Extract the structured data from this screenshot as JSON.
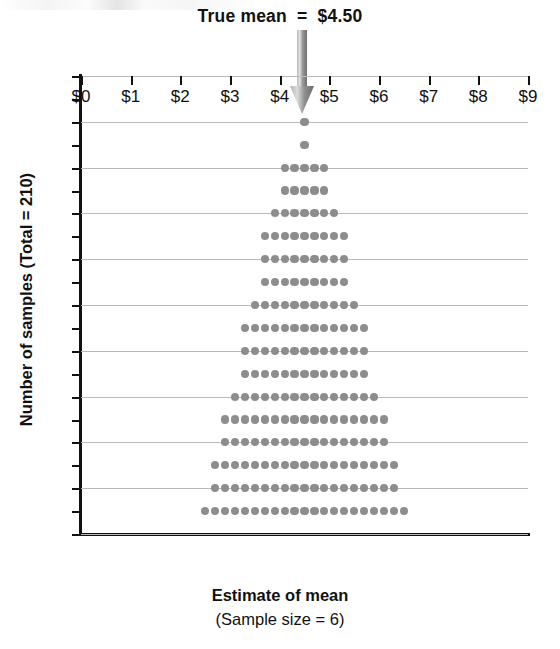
{
  "annotation": {
    "text": "True mean  =  $4.50",
    "arrow_icon": "down-arrow-icon",
    "arrow_value": 4.5,
    "arrow_color": "#8d8d8d"
  },
  "axes": {
    "x": {
      "title": "Estimate of mean",
      "subtitle": "(Sample size = 6)",
      "tick_labels": [
        "$0",
        "$1",
        "$2",
        "$3",
        "$4",
        "$5",
        "$6",
        "$7",
        "$8",
        "$9"
      ],
      "tick_values": [
        0,
        1,
        2,
        3,
        4,
        5,
        6,
        7,
        8,
        9
      ],
      "range": [
        0,
        9
      ]
    },
    "y": {
      "title": "Number of samples (Total = 210)",
      "tick_labels": [
        "0",
        "2",
        "4",
        "6",
        "8",
        "10",
        "12",
        "14",
        "16",
        "18",
        "20"
      ],
      "tick_values": [
        0,
        2,
        4,
        6,
        8,
        10,
        12,
        14,
        16,
        18,
        20
      ],
      "minor_tick_values": [
        1,
        3,
        5,
        7,
        9,
        11,
        13,
        15,
        17,
        19
      ],
      "range": [
        0,
        20
      ]
    }
  },
  "style": {
    "dot_color": "#8d8d8d",
    "grid_color": "#b9b9b9",
    "axis_color": "#111111",
    "background": "#ffffff"
  },
  "chart_data": {
    "type": "scatter",
    "subtype": "dotplot-sampling-distribution",
    "title": "True mean  =  $4.50",
    "xlabel": "Estimate of mean",
    "xsublabel": "(Sample size = 6)",
    "ylabel": "Number of samples (Total = 210)",
    "xlim": [
      0,
      9
    ],
    "ylim": [
      0,
      20
    ],
    "grid": "horizontal",
    "legend": "none",
    "bin_width": 0.2,
    "total_samples": 210,
    "true_mean": 4.5,
    "sample_size": 6,
    "annotations": [
      {
        "type": "arrow",
        "label": "True mean  =  $4.50",
        "x": 4.5,
        "points_to": 18
      }
    ],
    "stacks": [
      {
        "row": 18,
        "count": 1,
        "x_start": 4.5,
        "x_values": [
          4.5
        ]
      },
      {
        "row": 17,
        "count": 1,
        "x_start": 4.5,
        "x_values": [
          4.5
        ]
      },
      {
        "row": 16,
        "count": 5,
        "x_start": 4.1,
        "x_values": [
          4.1,
          4.3,
          4.5,
          4.7,
          4.9
        ]
      },
      {
        "row": 15,
        "count": 5,
        "x_start": 4.1,
        "x_values": [
          4.1,
          4.3,
          4.5,
          4.7,
          4.9
        ]
      },
      {
        "row": 14,
        "count": 7,
        "x_start": 3.9,
        "x_values": [
          3.9,
          4.1,
          4.3,
          4.5,
          4.7,
          4.9,
          5.1
        ]
      },
      {
        "row": 13,
        "count": 9,
        "x_start": 3.7,
        "x_values": [
          3.7,
          3.9,
          4.1,
          4.3,
          4.5,
          4.7,
          4.9,
          5.1,
          5.3
        ]
      },
      {
        "row": 12,
        "count": 9,
        "x_start": 3.7,
        "x_values": [
          3.7,
          3.9,
          4.1,
          4.3,
          4.5,
          4.7,
          4.9,
          5.1,
          5.3
        ]
      },
      {
        "row": 11,
        "count": 9,
        "x_start": 3.7,
        "x_values": [
          3.7,
          3.9,
          4.1,
          4.3,
          4.5,
          4.7,
          4.9,
          5.1,
          5.3
        ]
      },
      {
        "row": 10,
        "count": 11,
        "x_start": 3.5,
        "x_values": [
          3.5,
          3.7,
          3.9,
          4.1,
          4.3,
          4.5,
          4.7,
          4.9,
          5.1,
          5.3,
          5.5
        ]
      },
      {
        "row": 9,
        "count": 13,
        "x_start": 3.3,
        "x_values": [
          3.3,
          3.5,
          3.7,
          3.9,
          4.1,
          4.3,
          4.5,
          4.7,
          4.9,
          5.1,
          5.3,
          5.5,
          5.7
        ]
      },
      {
        "row": 8,
        "count": 13,
        "x_start": 3.3,
        "x_values": [
          3.3,
          3.5,
          3.7,
          3.9,
          4.1,
          4.3,
          4.5,
          4.7,
          4.9,
          5.1,
          5.3,
          5.5,
          5.7
        ]
      },
      {
        "row": 7,
        "count": 13,
        "x_start": 3.3,
        "x_values": [
          3.3,
          3.5,
          3.7,
          3.9,
          4.1,
          4.3,
          4.5,
          4.7,
          4.9,
          5.1,
          5.3,
          5.5,
          5.7
        ]
      },
      {
        "row": 6,
        "count": 15,
        "x_start": 3.1,
        "x_values": [
          3.1,
          3.3,
          3.5,
          3.7,
          3.9,
          4.1,
          4.3,
          4.5,
          4.7,
          4.9,
          5.1,
          5.3,
          5.5,
          5.7,
          5.9
        ]
      },
      {
        "row": 5,
        "count": 17,
        "x_start": 2.9,
        "x_values": [
          2.9,
          3.1,
          3.3,
          3.5,
          3.7,
          3.9,
          4.1,
          4.3,
          4.5,
          4.7,
          4.9,
          5.1,
          5.3,
          5.5,
          5.7,
          5.9,
          6.1
        ]
      },
      {
        "row": 4,
        "count": 17,
        "x_start": 2.9,
        "x_values": [
          2.9,
          3.1,
          3.3,
          3.5,
          3.7,
          3.9,
          4.1,
          4.3,
          4.5,
          4.7,
          4.9,
          5.1,
          5.3,
          5.5,
          5.7,
          5.9,
          6.1
        ]
      },
      {
        "row": 3,
        "count": 19,
        "x_start": 2.7,
        "x_values": [
          2.7,
          2.9,
          3.1,
          3.3,
          3.5,
          3.7,
          3.9,
          4.1,
          4.3,
          4.5,
          4.7,
          4.9,
          5.1,
          5.3,
          5.5,
          5.7,
          5.9,
          6.1,
          6.3
        ]
      },
      {
        "row": 2,
        "count": 19,
        "x_start": 2.7,
        "x_values": [
          2.7,
          2.9,
          3.1,
          3.3,
          3.5,
          3.7,
          3.9,
          4.1,
          4.3,
          4.5,
          4.7,
          4.9,
          5.1,
          5.3,
          5.5,
          5.7,
          5.9,
          6.1,
          6.3
        ]
      },
      {
        "row": 1,
        "count": 21,
        "x_start": 2.5,
        "x_values": [
          2.5,
          2.7,
          2.9,
          3.1,
          3.3,
          3.5,
          3.7,
          3.9,
          4.1,
          4.3,
          4.5,
          4.7,
          4.9,
          5.1,
          5.3,
          5.5,
          5.7,
          5.9,
          6.1,
          6.3,
          6.5
        ]
      }
    ]
  }
}
